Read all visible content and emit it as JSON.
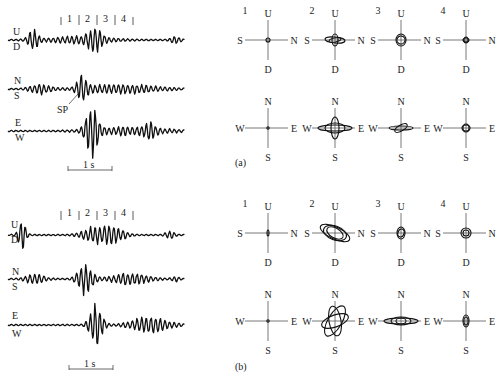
{
  "figure": {
    "panels": [
      {
        "id": "a",
        "label": "(a)",
        "seismogram": {
          "window_marks": [
            "1",
            "2",
            "3",
            "4"
          ],
          "components": [
            {
              "top": "U",
              "bottom": "D"
            },
            {
              "top": "N",
              "bottom": "S"
            },
            {
              "top": "E",
              "bottom": "W"
            }
          ],
          "annotation": "SP",
          "scale_bar": "1 s"
        },
        "hodograms_vertical": [
          {
            "index": "1",
            "up": "U",
            "down": "D",
            "left": "S",
            "right": "N"
          },
          {
            "index": "2",
            "up": "U",
            "down": "D",
            "left": "S",
            "right": "N"
          },
          {
            "index": "3",
            "up": "U",
            "down": "D",
            "left": "S",
            "right": "N"
          },
          {
            "index": "4",
            "up": "U",
            "down": "D",
            "left": "S",
            "right": "N"
          }
        ],
        "hodograms_horizontal": [
          {
            "up": "N",
            "down": "S",
            "left": "W",
            "right": "E"
          },
          {
            "up": "N",
            "down": "S",
            "left": "W",
            "right": "E"
          },
          {
            "up": "N",
            "down": "S",
            "left": "W",
            "right": "E"
          },
          {
            "up": "N",
            "down": "S",
            "left": "W",
            "right": "E"
          }
        ]
      },
      {
        "id": "b",
        "label": "(b)",
        "seismogram": {
          "window_marks": [
            "1",
            "2",
            "3",
            "4"
          ],
          "components": [
            {
              "top": "U",
              "bottom": "D"
            },
            {
              "top": "N",
              "bottom": "S"
            },
            {
              "top": "E",
              "bottom": "W"
            }
          ],
          "scale_bar": "1 s"
        },
        "hodograms_vertical": [
          {
            "index": "1",
            "up": "U",
            "down": "D",
            "left": "S",
            "right": "N"
          },
          {
            "index": "2",
            "up": "U",
            "down": "D",
            "left": "S",
            "right": "N"
          },
          {
            "index": "3",
            "up": "U",
            "down": "D",
            "left": "S",
            "right": "N"
          },
          {
            "index": "4",
            "up": "U",
            "down": "D",
            "left": "S",
            "right": "N"
          }
        ],
        "hodograms_horizontal": [
          {
            "up": "N",
            "down": "S",
            "left": "W",
            "right": "E"
          },
          {
            "up": "N",
            "down": "S",
            "left": "W",
            "right": "E"
          },
          {
            "up": "N",
            "down": "S",
            "left": "W",
            "right": "E"
          },
          {
            "up": "N",
            "down": "S",
            "left": "W",
            "right": "E"
          }
        ]
      }
    ]
  }
}
